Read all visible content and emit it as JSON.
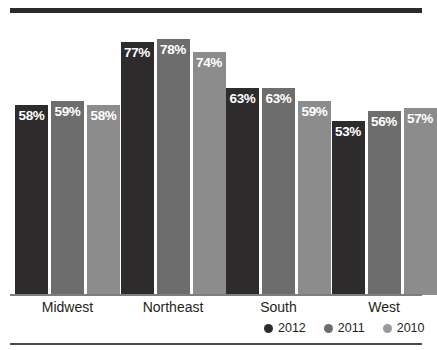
{
  "chart_data": {
    "type": "bar",
    "title": "",
    "subtitle": "",
    "xlabel": "",
    "ylabel": "",
    "grid": false,
    "ylim": [
      0,
      85
    ],
    "value_suffix": "%",
    "legend_position": "bottom-right",
    "categories": [
      "Midwest",
      "Northeast",
      "South",
      "West"
    ],
    "series": [
      {
        "name": "2012",
        "color": "#2d2b2c",
        "values": [
          58,
          59,
          58,
          0
        ],
        "labels": [
          "58%",
          "59%",
          "58%",
          ""
        ]
      }
    ],
    "series_by_year": [
      {
        "name": "2012",
        "color": "#2d2b2c",
        "values": [
          58,
          77,
          63,
          53
        ],
        "labels": [
          "58%",
          "77%",
          "63%",
          "53%"
        ]
      },
      {
        "name": "2011",
        "color": "#6e6d6d",
        "values": [
          59,
          78,
          63,
          56
        ],
        "labels": [
          "59%",
          "78%",
          "63%",
          "56%"
        ]
      },
      {
        "name": "2010",
        "color": "#8d8c8c",
        "values": [
          58,
          74,
          59,
          57
        ],
        "labels": [
          "58%",
          "74%",
          "59%",
          "57%"
        ]
      }
    ],
    "bars": [
      {
        "category": "Midwest",
        "series": "2012",
        "value": 58,
        "label": "58%"
      },
      {
        "category": "Midwest",
        "series": "2011",
        "value": 59,
        "label": "59%"
      },
      {
        "category": "Midwest",
        "series": "2010",
        "value": 58,
        "label": "58%"
      },
      {
        "category": "Northeast",
        "series": "2012",
        "value": 77,
        "label": "77%"
      },
      {
        "category": "Northeast",
        "series": "2011",
        "value": 78,
        "label": "78%"
      },
      {
        "category": "Northeast",
        "series": "2010",
        "value": 74,
        "label": "74%"
      },
      {
        "category": "South",
        "series": "2012",
        "value": 63,
        "label": "63%"
      },
      {
        "category": "South",
        "series": "2011",
        "value": 63,
        "label": "63%"
      },
      {
        "category": "South",
        "series": "2010",
        "value": 59,
        "label": "59%"
      },
      {
        "category": "West",
        "series": "2012",
        "value": 53,
        "label": "53%"
      },
      {
        "category": "West",
        "series": "2011",
        "value": 56,
        "label": "56%"
      },
      {
        "category": "West",
        "series": "2010",
        "value": 57,
        "label": "57%"
      }
    ]
  },
  "legend": {
    "items": [
      {
        "label": "2012",
        "color": "#2d2b2c"
      },
      {
        "label": "2011",
        "color": "#6e6d6d"
      },
      {
        "label": "2010",
        "color": "#9a9999"
      }
    ]
  },
  "axis": {
    "categories": [
      "Midwest",
      "Northeast",
      "South",
      "West"
    ]
  }
}
